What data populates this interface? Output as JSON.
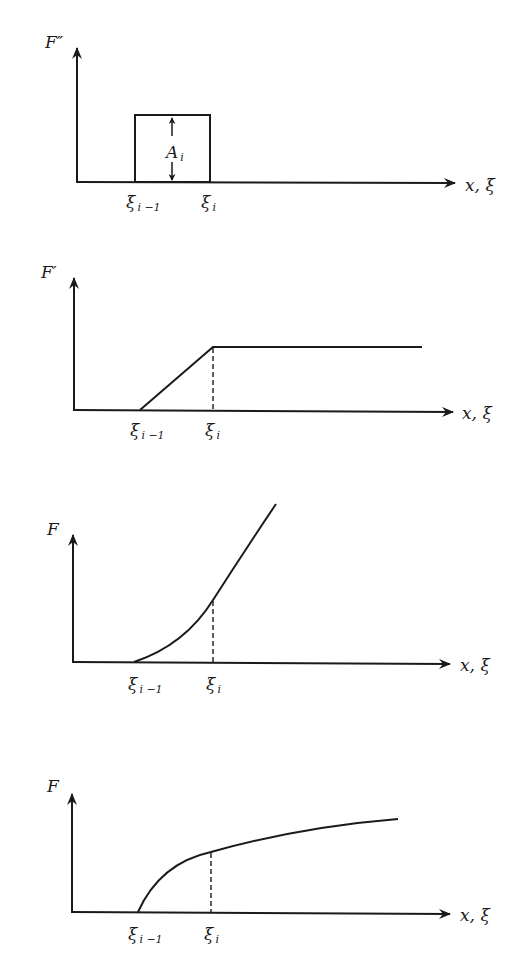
{
  "colors": {
    "ink": "#1a1a1a",
    "background": "#ffffff"
  },
  "panels": [
    {
      "id": "second-derivative",
      "ylabel": "F″",
      "xlabel": "x, ξ",
      "tick_left": {
        "base": "ξ",
        "sub": "i −1"
      },
      "tick_right": {
        "base": "ξ",
        "sub": "i"
      },
      "annotation": {
        "base": "A",
        "sub": "i"
      },
      "shape": "rectangle"
    },
    {
      "id": "first-derivative",
      "ylabel": "F′",
      "xlabel": "x, ξ",
      "tick_left": {
        "base": "ξ",
        "sub": "i −1"
      },
      "tick_right": {
        "base": "ξ",
        "sub": "i"
      },
      "shape": "ramp-then-flat"
    },
    {
      "id": "function-parabolic",
      "ylabel": "F",
      "xlabel": "x, ξ",
      "tick_left": {
        "base": "ξ",
        "sub": "i −1"
      },
      "tick_right": {
        "base": "ξ",
        "sub": "i"
      },
      "shape": "convex-increasing"
    },
    {
      "id": "function-concave",
      "ylabel": "F",
      "xlabel": "x, ξ",
      "tick_left": {
        "base": "ξ",
        "sub": "i −1"
      },
      "tick_right": {
        "base": "ξ",
        "sub": "i"
      },
      "shape": "concave-increasing"
    }
  ]
}
